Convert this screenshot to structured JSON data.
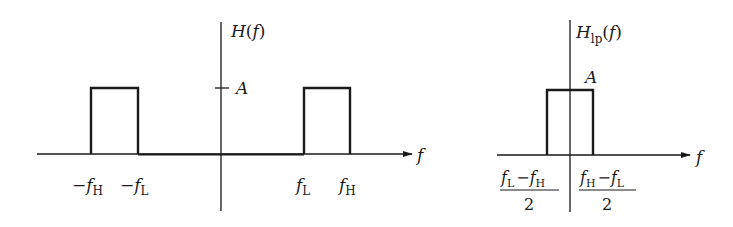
{
  "diagram": {
    "type": "frequency-response-plots",
    "colors": {
      "line": "#1a1a1a",
      "background": "#ffffff"
    },
    "left_plot": {
      "y_axis_label": {
        "main": "H",
        "arg": "(f)"
      },
      "x_axis_label": "f",
      "amplitude_label": "A",
      "ticks": [
        {
          "sign": "−",
          "var": "f",
          "sub": "H"
        },
        {
          "sign": "−",
          "var": "f",
          "sub": "L"
        },
        {
          "sign": "",
          "var": "f",
          "sub": "L"
        },
        {
          "sign": "",
          "var": "f",
          "sub": "H"
        }
      ],
      "description": "Bandpass response: rectangular pulses of height A from -fH to -fL and from fL to fH"
    },
    "right_plot": {
      "y_axis_label": {
        "main": "H",
        "sub": "lp",
        "arg": "(f)"
      },
      "x_axis_label": "f",
      "amplitude_label": "A",
      "ticks": [
        {
          "numerator_a": "f",
          "sub_a": "L",
          "op": "−",
          "numerator_b": "f",
          "sub_b": "H",
          "denominator": "2"
        },
        {
          "numerator_a": "f",
          "sub_a": "H",
          "op": "−",
          "numerator_b": "f",
          "sub_b": "L",
          "denominator": "2"
        }
      ],
      "description": "Lowpass equivalent: rectangular pulse of height A from (fL-fH)/2 to (fH-fL)/2"
    }
  }
}
